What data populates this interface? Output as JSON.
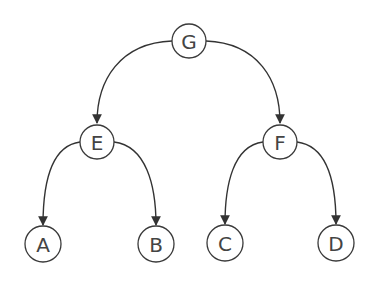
{
  "diagram": {
    "type": "binary-tree",
    "nodes": [
      {
        "id": "G",
        "label": "G",
        "x": 189,
        "y": 41
      },
      {
        "id": "E",
        "label": "E",
        "x": 97,
        "y": 142
      },
      {
        "id": "F",
        "label": "F",
        "x": 280,
        "y": 142
      },
      {
        "id": "A",
        "label": "A",
        "x": 43,
        "y": 244
      },
      {
        "id": "B",
        "label": "B",
        "x": 156,
        "y": 244
      },
      {
        "id": "C",
        "label": "C",
        "x": 225,
        "y": 243
      },
      {
        "id": "D",
        "label": "D",
        "x": 336,
        "y": 243
      }
    ],
    "edges": [
      {
        "from": "G",
        "to": "E"
      },
      {
        "from": "G",
        "to": "F"
      },
      {
        "from": "E",
        "to": "A"
      },
      {
        "from": "E",
        "to": "B"
      },
      {
        "from": "F",
        "to": "C"
      },
      {
        "from": "F",
        "to": "D"
      }
    ],
    "colors": {
      "stroke": "#333333",
      "text": "#444444",
      "background": "#ffffff"
    }
  }
}
